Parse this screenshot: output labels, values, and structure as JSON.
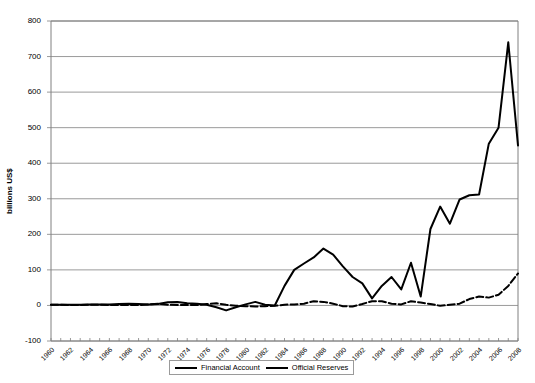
{
  "chart_data": {
    "type": "line",
    "title": "",
    "xlabel": "",
    "ylabel": "billions US$",
    "ylim": [
      -100,
      800
    ],
    "ytick_step": 100,
    "yticks": [
      800,
      700,
      600,
      500,
      400,
      300,
      200,
      100,
      0,
      -100
    ],
    "grid": true,
    "legend_position": "bottom-center",
    "xlim": [
      1960,
      2008
    ],
    "x": [
      1960,
      1961,
      1962,
      1963,
      1964,
      1965,
      1966,
      1967,
      1968,
      1969,
      1970,
      1971,
      1972,
      1973,
      1974,
      1975,
      1976,
      1977,
      1978,
      1979,
      1980,
      1981,
      1982,
      1983,
      1984,
      1985,
      1986,
      1987,
      1988,
      1989,
      1990,
      1991,
      1992,
      1993,
      1994,
      1995,
      1996,
      1997,
      1998,
      1999,
      2000,
      2001,
      2002,
      2003,
      2004,
      2005,
      2006,
      2007,
      2008
    ],
    "xtick_labels": [
      "1960",
      "1962",
      "1964",
      "1966",
      "1968",
      "1970",
      "1972",
      "1974",
      "1976",
      "1978",
      "1980",
      "1982",
      "1984",
      "1986",
      "1988",
      "1990",
      "1992",
      "1994",
      "1996",
      "1998",
      "2000",
      "2002",
      "2004",
      "2006",
      "2008"
    ],
    "series": [
      {
        "name": "Financial Account",
        "style": "solid",
        "color": "#000000",
        "values": [
          2,
          2,
          2,
          2,
          3,
          3,
          3,
          4,
          5,
          4,
          3,
          4,
          9,
          10,
          6,
          5,
          2,
          -5,
          -14,
          -5,
          3,
          10,
          2,
          0,
          55,
          100,
          118,
          135,
          160,
          143,
          110,
          80,
          62,
          20,
          55,
          80,
          45,
          120,
          25,
          215,
          278,
          230,
          298,
          310,
          312,
          455,
          500,
          740,
          450
        ]
      },
      {
        "name": "Official Reserves",
        "style": "dashed",
        "color": "#000000",
        "values": [
          2,
          2,
          1,
          1,
          2,
          2,
          1,
          1,
          1,
          1,
          3,
          5,
          2,
          1,
          1,
          1,
          4,
          6,
          2,
          -1,
          -2,
          -3,
          -2,
          -1,
          2,
          3,
          5,
          12,
          10,
          5,
          -2,
          -3,
          4,
          12,
          12,
          5,
          3,
          12,
          8,
          4,
          -1,
          2,
          5,
          18,
          25,
          22,
          30,
          55,
          90
        ]
      }
    ],
    "annotations": []
  },
  "legend": {
    "items": [
      {
        "label": "Financial Account",
        "style": "solid"
      },
      {
        "label": "Official Reserves",
        "style": "dashed"
      }
    ]
  }
}
